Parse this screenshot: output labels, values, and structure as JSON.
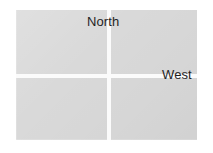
{
  "figure": {
    "name": "quadrant-direction-map",
    "background_color": "#ffffff",
    "plate_color": "#d9d9d9",
    "divider_color": "#fbfbfb",
    "label_color": "#1f1f1f"
  },
  "labels": {
    "north": "North",
    "west": "West"
  },
  "quadrants": [
    {
      "id": "top-left",
      "label": ""
    },
    {
      "id": "top-right",
      "label": ""
    },
    {
      "id": "bottom-left",
      "label": ""
    },
    {
      "id": "bottom-right",
      "label": ""
    }
  ]
}
